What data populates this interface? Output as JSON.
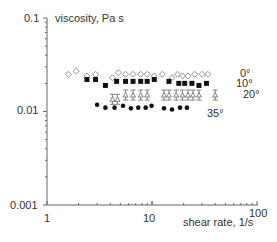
{
  "chart_data": {
    "type": "scatter",
    "title": "",
    "xlabel": "shear rate, 1/s",
    "ylabel": "viscosity, Pa s",
    "xscale": "log",
    "yscale": "log",
    "xlim": [
      1,
      100
    ],
    "ylim": [
      0.001,
      0.1
    ],
    "x_ticks": [
      "1",
      "10",
      "100"
    ],
    "y_ticks": [
      "0.001",
      "0.01",
      "0.1"
    ],
    "grid": false,
    "legend_position": "inline-right",
    "series": [
      {
        "name": "0°",
        "marker": "open-diamond",
        "x": [
          1.6,
          1.9,
          2.4,
          2.9,
          4.2,
          4.8,
          5.6,
          6.6,
          7.8,
          9.0,
          10.5,
          12.5,
          15.5,
          17.5,
          19.5,
          22.0,
          25.5,
          30.0,
          34.0
        ],
        "y": [
          0.025,
          0.027,
          0.024,
          0.025,
          0.023,
          0.026,
          0.025,
          0.025,
          0.025,
          0.025,
          0.024,
          0.025,
          0.023,
          0.025,
          0.024,
          0.024,
          0.025,
          0.025,
          0.025
        ]
      },
      {
        "name": "10°",
        "marker": "filled-square",
        "x": [
          2.4,
          2.9,
          3.6,
          4.6,
          5.6,
          6.6,
          7.8,
          9.0,
          10.5,
          14.5,
          18.0,
          20.5,
          24.0,
          28.0,
          33.0
        ],
        "y": [
          0.022,
          0.022,
          0.019,
          0.021,
          0.021,
          0.021,
          0.021,
          0.021,
          0.022,
          0.021,
          0.02,
          0.02,
          0.02,
          0.019,
          0.02
        ]
      },
      {
        "name": "20°",
        "marker": "open-triangle-with-errorbars",
        "x": [
          4.2,
          4.7,
          5.6,
          6.6,
          7.8,
          9.0,
          13.0,
          14.5,
          17.0,
          19.5,
          22.0,
          24.5,
          28.0,
          40.0
        ],
        "y": [
          0.0135,
          0.0135,
          0.015,
          0.015,
          0.015,
          0.015,
          0.015,
          0.015,
          0.015,
          0.015,
          0.015,
          0.015,
          0.015,
          0.015
        ]
      },
      {
        "name": "35°",
        "marker": "filled-circle",
        "x": [
          3.0,
          3.6,
          4.4,
          5.3,
          6.3,
          7.4,
          8.7,
          9.9,
          13.0,
          15.5,
          18.5,
          21.5
        ],
        "y": [
          0.0118,
          0.011,
          0.011,
          0.0115,
          0.0108,
          0.011,
          0.011,
          0.0115,
          0.0108,
          0.0105,
          0.011,
          0.011
        ]
      }
    ],
    "annotations": [
      "0°",
      "10°",
      "20°",
      "35°"
    ]
  },
  "labels": {
    "ylabel": "viscosity, Pa s",
    "xlabel": "shear rate, 1/s",
    "y_top": "0.1",
    "y_mid": "0.01",
    "y_bot": "0.001",
    "x_left": "1",
    "x_mid": "10",
    "x_right": "100",
    "s0": "0°",
    "s10": "10°",
    "s20": "20°",
    "s35": "35°"
  }
}
